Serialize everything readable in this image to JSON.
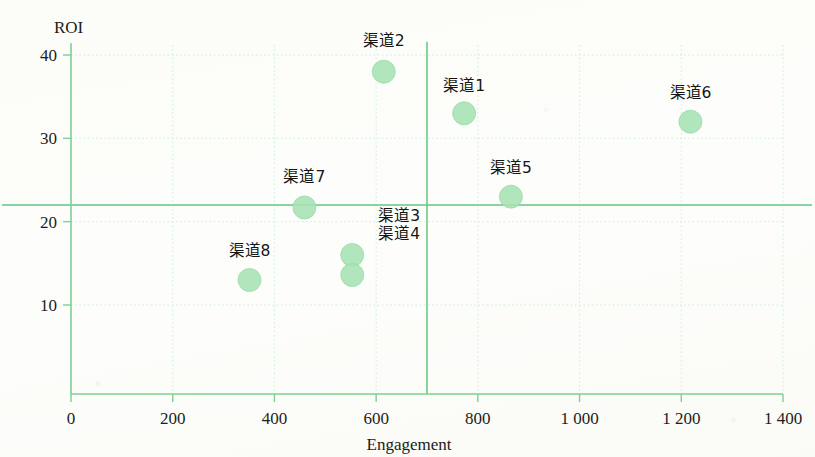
{
  "chart_data": {
    "type": "scatter",
    "title": "",
    "xlabel": "Engagement",
    "ylabel": "ROI",
    "xlim": [
      0,
      1400
    ],
    "ylim": [
      0,
      42
    ],
    "xticks": [
      0,
      200,
      400,
      600,
      800,
      1000,
      1200,
      1400
    ],
    "xtick_labels": [
      "0",
      "200",
      "400",
      "600",
      "800",
      "1 000",
      "1 200",
      "1 400"
    ],
    "yticks": [
      10,
      20,
      30,
      40
    ],
    "ytick_labels": [
      "10",
      "20",
      "30",
      "40"
    ],
    "grid": true,
    "grid_style": "dotted",
    "legend": "none",
    "marker_color": "#a6e3b4",
    "marker_edge_color": "#8fd9a3",
    "axis_color": "#7fcf92",
    "reference_lines": [
      {
        "orientation": "vertical",
        "value": 700,
        "color": "#62c77f"
      },
      {
        "orientation": "horizontal",
        "value": 22,
        "color": "#62c77f"
      }
    ],
    "points": [
      {
        "label": "渠道1",
        "x": 773,
        "y": 33,
        "label_dx": 0,
        "label_dy": -22,
        "label_anchor": "middle"
      },
      {
        "label": "渠道2",
        "x": 615,
        "y": 38,
        "label_dx": 0,
        "label_dy": -26,
        "label_anchor": "middle"
      },
      {
        "label": "渠道3",
        "x": 553,
        "y": 16,
        "label_dx": 26,
        "label_dy": -34,
        "label_anchor": "start"
      },
      {
        "label": "渠道4",
        "x": 553,
        "y": 13.6,
        "label_dx": 26,
        "label_dy": -36,
        "label_anchor": "start"
      },
      {
        "label": "渠道5",
        "x": 865,
        "y": 23,
        "label_dx": 0,
        "label_dy": -24,
        "label_anchor": "middle"
      },
      {
        "label": "渠道6",
        "x": 1218,
        "y": 32,
        "label_dx": 0,
        "label_dy": -24,
        "label_anchor": "middle"
      },
      {
        "label": "渠道7",
        "x": 459,
        "y": 21.7,
        "label_dx": 0,
        "label_dy": -26,
        "label_anchor": "middle"
      },
      {
        "label": "渠道8",
        "x": 351,
        "y": 13,
        "label_dx": 0,
        "label_dy": -24,
        "label_anchor": "middle"
      }
    ]
  }
}
